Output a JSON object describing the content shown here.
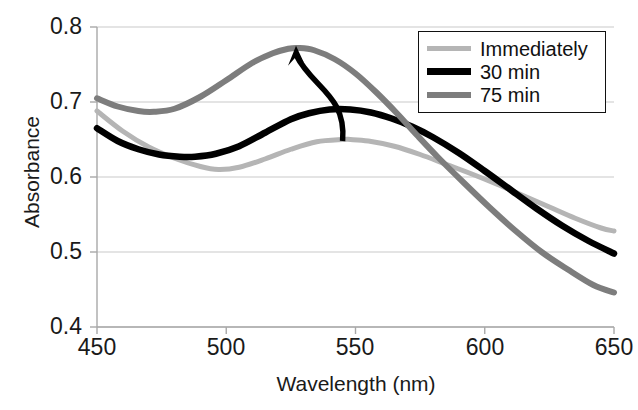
{
  "chart_data": {
    "type": "line",
    "title": "",
    "xlabel": "Wavelength (nm)",
    "ylabel": "Absorbance",
    "xlim": [
      450,
      650
    ],
    "ylim": [
      0.4,
      0.8
    ],
    "xticks": [
      "450",
      "500",
      "550",
      "600",
      "650"
    ],
    "yticks": [
      "0.8",
      "0.7",
      "0.6",
      "0.5",
      "0.4"
    ],
    "grid": "horizontal",
    "legend_position": "top-right",
    "series": [
      {
        "name": "Immediately",
        "color": "#b5b5b5",
        "x": [
          450,
          460,
          470,
          480,
          490,
          497,
          505,
          515,
          525,
          535,
          545,
          548,
          555,
          565,
          575,
          585,
          595,
          605,
          615,
          625,
          635,
          645,
          650
        ],
        "values": [
          0.688,
          0.661,
          0.64,
          0.625,
          0.614,
          0.61,
          0.613,
          0.624,
          0.637,
          0.647,
          0.65,
          0.65,
          0.648,
          0.641,
          0.63,
          0.617,
          0.604,
          0.59,
          0.575,
          0.56,
          0.545,
          0.532,
          0.528
        ]
      },
      {
        "name": "30 min",
        "color": "#000000",
        "x": [
          450,
          458,
          466,
          474,
          482,
          488,
          496,
          505,
          515,
          525,
          532,
          540,
          548,
          556,
          564,
          572,
          580,
          590,
          600,
          610,
          620,
          630,
          640,
          650
        ],
        "values": [
          0.665,
          0.648,
          0.637,
          0.63,
          0.627,
          0.627,
          0.631,
          0.641,
          0.659,
          0.677,
          0.685,
          0.69,
          0.69,
          0.686,
          0.678,
          0.667,
          0.653,
          0.632,
          0.608,
          0.583,
          0.558,
          0.535,
          0.515,
          0.498
        ]
      },
      {
        "name": "75 min",
        "color": "#7d7d7d",
        "x": [
          450,
          458,
          466,
          472,
          480,
          490,
          500,
          510,
          518,
          524,
          528,
          534,
          542,
          550,
          558,
          566,
          574,
          582,
          592,
          602,
          612,
          622,
          632,
          642,
          650
        ],
        "values": [
          0.705,
          0.694,
          0.688,
          0.687,
          0.691,
          0.707,
          0.729,
          0.752,
          0.765,
          0.771,
          0.772,
          0.769,
          0.757,
          0.738,
          0.713,
          0.685,
          0.655,
          0.626,
          0.592,
          0.559,
          0.528,
          0.5,
          0.477,
          0.456,
          0.446
        ]
      }
    ],
    "annotations": [
      {
        "name": "trend-arrow",
        "type": "arrow",
        "from": [
          545,
          0.648
        ],
        "to": [
          527,
          0.775
        ],
        "color": "#000000"
      }
    ]
  },
  "legend": {
    "items": [
      {
        "label": "Immediately",
        "color": "#b5b5b5",
        "width": 5
      },
      {
        "label": "30 min",
        "color": "#000000",
        "width": 7
      },
      {
        "label": "75 min",
        "color": "#7d7d7d",
        "width": 6
      }
    ]
  },
  "axes": {
    "y_title": "Absorbance",
    "x_title": "Wavelength (nm)",
    "y_tick_labels": [
      "0.8",
      "0.7",
      "0.6",
      "0.5",
      "0.4"
    ],
    "x_tick_labels": [
      "450",
      "500",
      "550",
      "600",
      "650"
    ]
  }
}
